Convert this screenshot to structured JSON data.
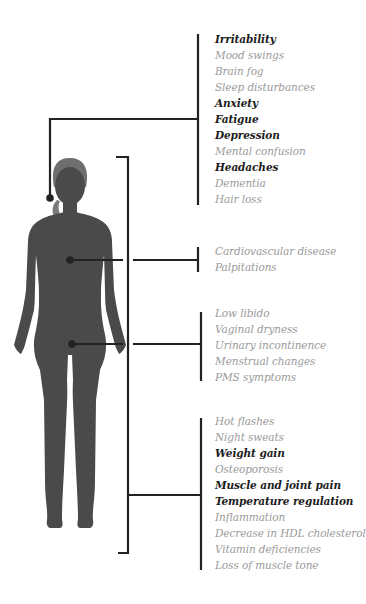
{
  "colors": {
    "silhouette": "#4a4a4a",
    "hair": "#6e6e6e",
    "line": "#222222",
    "bold_text": "#1c1c1c",
    "muted_text": "#9a9a9a"
  },
  "groups": [
    {
      "region": "head",
      "items": [
        {
          "label": "Irritability",
          "emphasis": "bold"
        },
        {
          "label": "Mood swings",
          "emphasis": "normal"
        },
        {
          "label": "Brain fog",
          "emphasis": "normal"
        },
        {
          "label": "Sleep disturbances",
          "emphasis": "normal"
        },
        {
          "label": "Anxiety",
          "emphasis": "bold"
        },
        {
          "label": "Fatigue",
          "emphasis": "bold"
        },
        {
          "label": "Depression",
          "emphasis": "bold"
        },
        {
          "label": "Mental confusion",
          "emphasis": "normal"
        },
        {
          "label": "Headaches",
          "emphasis": "bold"
        },
        {
          "label": "Dementia",
          "emphasis": "normal"
        },
        {
          "label": "Hair loss",
          "emphasis": "normal"
        }
      ]
    },
    {
      "region": "chest",
      "items": [
        {
          "label": "Cardiovascular disease",
          "emphasis": "normal"
        },
        {
          "label": "Palpitations",
          "emphasis": "normal"
        }
      ]
    },
    {
      "region": "pelvis",
      "items": [
        {
          "label": "Low libido",
          "emphasis": "normal"
        },
        {
          "label": "Vaginal dryness",
          "emphasis": "normal"
        },
        {
          "label": "Urinary incontinence",
          "emphasis": "normal"
        },
        {
          "label": "Menstrual changes",
          "emphasis": "normal"
        },
        {
          "label": "PMS symptoms",
          "emphasis": "normal"
        }
      ]
    },
    {
      "region": "whole-body",
      "items": [
        {
          "label": "Hot flashes",
          "emphasis": "normal"
        },
        {
          "label": "Night sweats",
          "emphasis": "normal"
        },
        {
          "label": "Weight gain",
          "emphasis": "bold"
        },
        {
          "label": "Osteoporosis",
          "emphasis": "normal"
        },
        {
          "label": "Muscle and joint pain",
          "emphasis": "bold"
        },
        {
          "label": "Temperature regulation",
          "emphasis": "bold"
        },
        {
          "label": "Inflammation",
          "emphasis": "normal"
        },
        {
          "label": "Decrease in HDL cholesterol",
          "emphasis": "normal"
        },
        {
          "label": "Vitamin deficiencies",
          "emphasis": "normal"
        },
        {
          "label": "Loss of muscle tone",
          "emphasis": "normal"
        }
      ]
    }
  ]
}
